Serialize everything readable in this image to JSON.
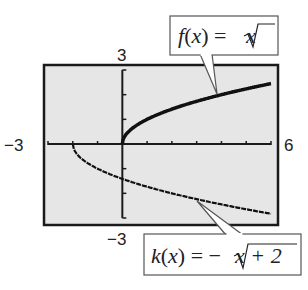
{
  "chart_data": {
    "type": "line",
    "title": "",
    "xlabel": "",
    "ylabel": "",
    "xlim": [
      -3,
      6
    ],
    "ylim": [
      -3,
      3
    ],
    "xscale_ticks": 1,
    "yscale_ticks": 1,
    "grid": false,
    "tick_labels": {
      "xmin": "−3",
      "xmax": "6",
      "ymax": "3",
      "ymin": "−3"
    },
    "series": [
      {
        "name": "f",
        "expression": "sqrt(x)",
        "domain": [
          0,
          6
        ],
        "label_parts": {
          "func": "f",
          "arg": "x",
          "eq": " = ",
          "radicand": "x",
          "prefix": ""
        },
        "label": "f(x) = √x"
      },
      {
        "name": "k",
        "expression": "-sqrt(x+2)",
        "domain": [
          -2,
          6
        ],
        "label_parts": {
          "func": "k",
          "arg": "x",
          "eq": " = ",
          "radicand": "x + 2",
          "prefix": "−"
        },
        "label": "k(x) = −√(x + 2)"
      }
    ],
    "colors": {
      "background": "#e6e6e6",
      "frame": "#1a1a1a",
      "curve": "#111111",
      "callout_border": "#555555"
    }
  }
}
